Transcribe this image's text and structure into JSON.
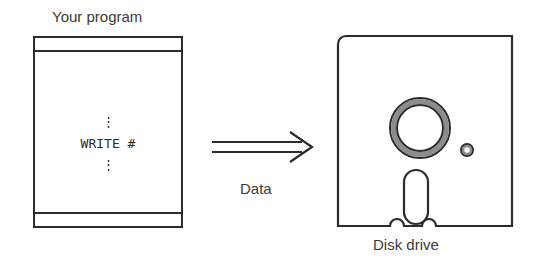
{
  "diagram": {
    "title_label": "Your program",
    "flow_label": "Data",
    "target_label": "Disk drive",
    "program_code": {
      "dots_above": "⋮",
      "statement": "WRITE #",
      "dots_below": "⋮"
    },
    "icons": {
      "arrow": "double-line-right-arrow-icon",
      "program_listing": "program-listing-box-icon",
      "disk": "floppy-disk-drive-icon",
      "hub": "disk-hub-ring-icon",
      "index_hole": "disk-index-hole-icon",
      "head_slot": "disk-head-slot-icon"
    },
    "colors": {
      "stroke": "#2b2b2b",
      "text": "#3a3a3a",
      "shade": "#8c8c8c",
      "background": "#ffffff"
    }
  }
}
